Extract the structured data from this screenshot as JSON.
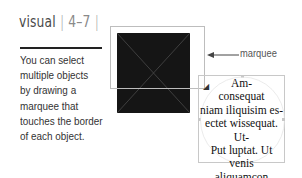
{
  "header": {
    "section": "visual",
    "separator_left": "|",
    "page": "4–7",
    "separator_right": "|"
  },
  "caption": {
    "lines": [
      "You can select",
      "multiple objects",
      "by drawing a",
      "marquee that",
      "touches the border",
      "of each object."
    ]
  },
  "illustration": {
    "callout_label": "marquee",
    "frame_text": {
      "lines": [
        "Am-",
        "consequat",
        "niam iliquisim es-",
        "ectet wissequat. Ut-",
        "Put luptat. Ut venis",
        "aliquamcon",
        "velenis"
      ]
    },
    "colors": {
      "dark_square": "#151515",
      "marquee_border": "#bdbdbd",
      "frame_border": "#c8c8c8"
    }
  }
}
